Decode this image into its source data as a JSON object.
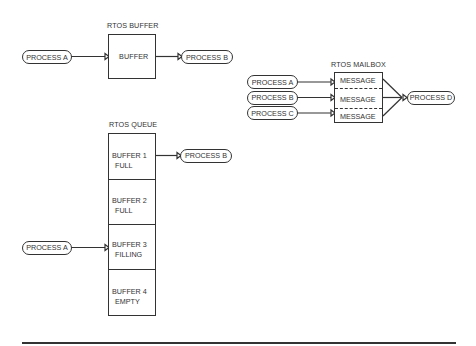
{
  "rtos_buffer": {
    "title": "RTOS BUFFER",
    "box_label": "BUFFER",
    "producer": "PROCESS A",
    "consumer": "PROCESS B"
  },
  "rtos_mailbox": {
    "title": "RTOS MAILBOX",
    "producers": [
      "PROCESS A",
      "PROCESS B",
      "PROCESS C"
    ],
    "slots": [
      "MESSAGE",
      "MESSAGE",
      "MESSAGE"
    ],
    "consumer": "PROCESS D"
  },
  "rtos_queue": {
    "title": "RTOS QUEUE",
    "producer": "PROCESS A",
    "consumer": "PROCESS B",
    "buffers": [
      {
        "name": "BUFFER 1",
        "state": "FULL"
      },
      {
        "name": "BUFFER 2",
        "state": "FULL"
      },
      {
        "name": "BUFFER 3",
        "state": "FILLING"
      },
      {
        "name": "BUFFER 4",
        "state": "EMPTY"
      }
    ]
  },
  "colors": {
    "line": "#333333",
    "background": "#ffffff"
  }
}
